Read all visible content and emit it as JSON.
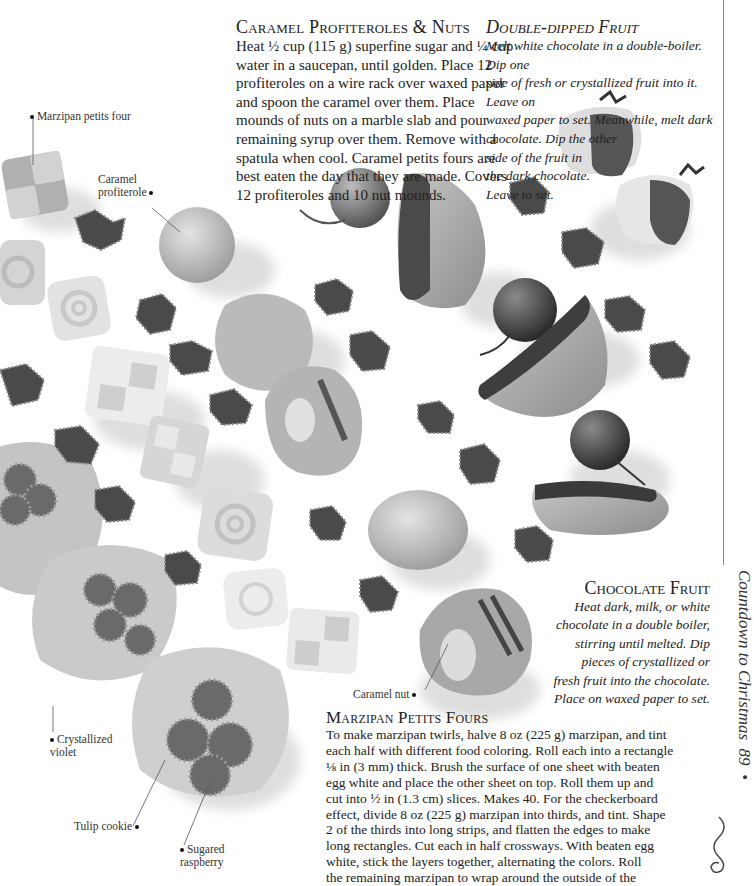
{
  "sections": {
    "caramel_profiteroles": {
      "title": "Caramel Profiteroles & Nuts",
      "lines": [
        "Heat ½ cup (115 g) superfine sugar and ¼ cup",
        "water in a saucepan, until golden. Place 12",
        "profiteroles on a wire rack over waxed paper",
        "and spoon the caramel over them. Place",
        "mounds of nuts on a marble slab and pour",
        "remaining syrup over them. Remove with a",
        "spatula when cool. Caramel petits fours are",
        "best eaten the day that they are made. Covers",
        "12 profiteroles and 10 nut mounds."
      ]
    },
    "double_dipped_fruit": {
      "title": "Double-dipped Fruit",
      "lines": [
        "Melt white chocolate in a double-boiler. Dip one",
        "side of fresh or crystallized fruit into it. Leave on",
        "waxed paper to set. Meanwhile, melt dark",
        "chocolate. Dip the other",
        "side of the fruit in",
        "the dark chocolate.",
        "Leave to set."
      ]
    },
    "chocolate_fruit": {
      "title": "Chocolate Fruit",
      "lines": [
        "Heat dark, milk, or white",
        "chocolate in a double boiler,",
        "stirring until melted. Dip",
        "pieces of crystallized or",
        "fresh fruit into the chocolate.",
        "Place on waxed paper to set."
      ]
    },
    "marzipan_petits_fours": {
      "title": "Marzipan Petits Fours",
      "lines": [
        "To make marzipan twirls, halve 8 oz (225 g) marzipan, and tint",
        "each half with different food coloring. Roll each into a rectangle",
        "⅛ in (3 mm) thick. Brush the surface of one sheet with beaten",
        "egg white and place the other sheet on top. Roll them up and",
        "cut into ½ in (1.3 cm) slices. Makes 40. For the checkerboard",
        "effect, divide 8 oz (225 g) marzipan into thirds, and tint. Shape",
        "2 of the thirds into long strips, and flatten the edges to make",
        "long rectangles. Cut each in half crossways. With beaten egg",
        "white, stick the layers together, alternating the colors. Roll",
        "the remaining marzipan to wrap around the outside of the"
      ]
    }
  },
  "labels": {
    "marzipan_petits_four": "Marzipan petits four",
    "caramel_profiterole": [
      "Caramel",
      "profiterole"
    ],
    "caramel_nut": "Caramel nut",
    "crystallized_violet": [
      "Crystallized",
      "violet"
    ],
    "tulip_cookie": "Tulip cookie",
    "sugared_raspberry": [
      "Sugared",
      "raspberry"
    ]
  },
  "folio": {
    "running_head": "Countdown to Christmas",
    "page_number": "89"
  }
}
